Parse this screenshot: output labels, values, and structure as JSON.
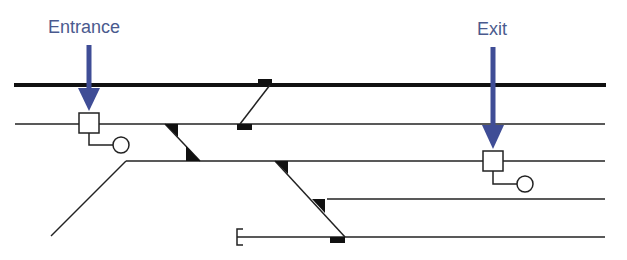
{
  "labels": {
    "entrance": "Entrance",
    "exit": "Exit"
  },
  "colors": {
    "arrow": "#3f4d96",
    "label": "#4a5a8e",
    "track": "#111111"
  }
}
